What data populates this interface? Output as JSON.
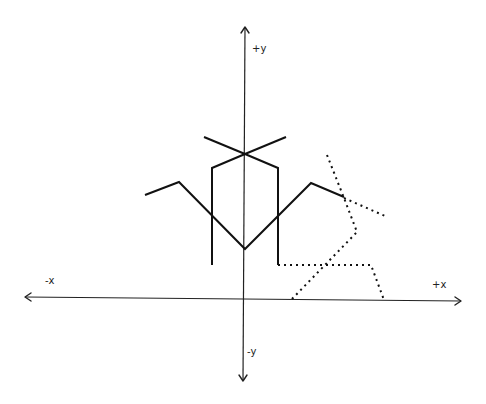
{
  "diagram": {
    "axes": {
      "labels": {
        "pos_y": "+y",
        "neg_y": "-y",
        "pos_x": "+x",
        "neg_x": "-x"
      }
    },
    "colors": {
      "background": "#ffffff",
      "line": "#111111"
    }
  }
}
